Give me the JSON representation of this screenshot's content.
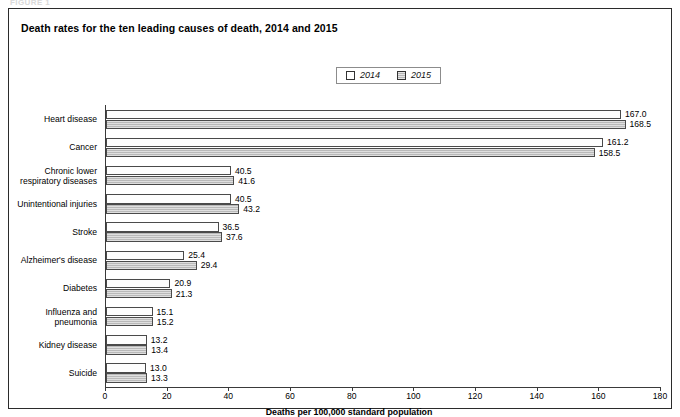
{
  "figure": {
    "strip_label": "FIGURE 1",
    "title": "Death rates for the ten leading causes of death, 2014 and 2015"
  },
  "legend": {
    "position": "top-center",
    "entries": [
      {
        "label": "2014",
        "swatch": "legend-swatch-2014",
        "color": "#ffffff"
      },
      {
        "label": "2015",
        "swatch": "legend-swatch-2015",
        "color": "#b9b9b9"
      }
    ]
  },
  "chart_data": {
    "type": "bar",
    "orientation": "horizontal",
    "title": "Death rates for the ten leading causes of death, 2014 and 2015",
    "xlabel": "Deaths per 100,000 standard population",
    "ylabel": "",
    "xlim": [
      0,
      180
    ],
    "xticks": [
      0,
      20,
      40,
      60,
      80,
      100,
      120,
      140,
      160,
      180
    ],
    "xtick_labels": [
      "0",
      "20",
      "40",
      "60",
      "80",
      "100",
      "120",
      "140",
      "160",
      "180"
    ],
    "grid": false,
    "legend_position": "top-center",
    "categories": [
      "Heart disease",
      "Cancer",
      "Chronic lower\nrespiratory diseases",
      "Unintentional injuries",
      "Stroke",
      "Alzheimer's disease",
      "Diabetes",
      "Influenza and\npneumonia",
      "Kidney disease",
      "Suicide"
    ],
    "series": [
      {
        "name": "2014",
        "values": [
          167.0,
          161.2,
          40.5,
          40.5,
          36.5,
          25.4,
          20.9,
          15.1,
          13.2,
          13.0
        ],
        "labels": [
          "167.0",
          "161.2",
          "40.5",
          "40.5",
          "36.5",
          "25.4",
          "20.9",
          "15.1",
          "13.2",
          "13.0"
        ]
      },
      {
        "name": "2015",
        "values": [
          168.5,
          158.5,
          41.6,
          43.2,
          37.6,
          29.4,
          21.3,
          15.2,
          13.4,
          13.3
        ],
        "labels": [
          "168.5",
          "158.5",
          "41.6",
          "43.2",
          "37.6",
          "29.4",
          "21.3",
          "15.2",
          "13.4",
          "13.3"
        ]
      }
    ]
  }
}
